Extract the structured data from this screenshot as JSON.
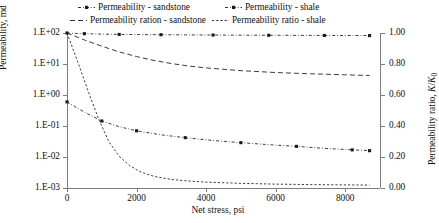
{
  "chart_data": {
    "type": "line",
    "title": "",
    "xlabel": "Net stress, psi",
    "ylabel_left": "Permeability, md",
    "ylabel_right": "Permeability ratio, K/K0",
    "xlim": [
      0,
      9000
    ],
    "xticks": [
      0,
      2000,
      4000,
      6000,
      8000
    ],
    "xticklabels": [
      "0",
      "2000",
      "4000",
      "6000",
      "8000"
    ],
    "y_left_scale": "log",
    "ylim_left": [
      0.001,
      100
    ],
    "yticks_left": [
      100,
      10,
      1,
      0.1,
      0.01,
      0.001
    ],
    "yticklabels_left": [
      "1.E+02",
      "1.E+01",
      "1.E+00",
      "1.E-01",
      "1.E-02",
      "1.E-03"
    ],
    "y_right_scale": "linear",
    "ylim_right": [
      0.0,
      1.0
    ],
    "yticks_right": [
      1.0,
      0.8,
      0.6,
      0.4,
      0.2,
      0.0
    ],
    "yticklabels_right": [
      "1.00",
      "0.80",
      "0.60",
      "0.40",
      "0.20",
      "0.00"
    ],
    "grid": false,
    "legend_position": "top",
    "series": [
      {
        "name": "Permeability - sandstone",
        "axis": "left",
        "style": "dash-dot",
        "marker": "square",
        "x": [
          0,
          250,
          500,
          1000,
          1500,
          2000,
          2700,
          3400,
          4200,
          5000,
          5800,
          6600,
          7400,
          8200,
          8700
        ],
        "y": [
          100,
          97,
          95,
          92,
          90,
          89,
          88,
          87,
          86,
          85,
          84.5,
          84,
          83.5,
          83,
          82.5
        ]
      },
      {
        "name": "Permeability ration - sandstone",
        "axis": "right",
        "style": "dashed",
        "marker": "none",
        "x": [
          0,
          500,
          1000,
          1500,
          2000,
          2500,
          3000,
          3500,
          4000,
          5000,
          6000,
          7000,
          8000,
          8700
        ],
        "y": [
          1.0,
          0.955,
          0.915,
          0.878,
          0.848,
          0.823,
          0.803,
          0.787,
          0.775,
          0.757,
          0.745,
          0.737,
          0.73,
          0.726
        ]
      },
      {
        "name": "Permeability - shale",
        "axis": "left",
        "style": "dash-dot",
        "marker": "square",
        "x": [
          0,
          500,
          1000,
          1500,
          2000,
          2700,
          3400,
          4200,
          5000,
          5800,
          6600,
          7400,
          8200,
          8700
        ],
        "y": [
          0.6,
          0.28,
          0.145,
          0.095,
          0.07,
          0.052,
          0.042,
          0.034,
          0.029,
          0.025,
          0.022,
          0.019,
          0.017,
          0.016
        ]
      },
      {
        "name": "Permeability ratio - shale",
        "axis": "right",
        "style": "dotted",
        "marker": "none",
        "x": [
          0,
          300,
          600,
          900,
          1200,
          1500,
          1800,
          2100,
          2500,
          3000,
          3500,
          4000,
          5000,
          6000,
          7000,
          8000,
          8700
        ],
        "y": [
          1.0,
          0.82,
          0.63,
          0.45,
          0.3,
          0.205,
          0.145,
          0.105,
          0.075,
          0.055,
          0.045,
          0.038,
          0.03,
          0.025,
          0.022,
          0.02,
          0.019
        ]
      }
    ]
  },
  "legend": {
    "items": [
      {
        "label": "Permeability - sandstone",
        "key": "dash-dot-marker-key"
      },
      {
        "label": "Permeability - shale",
        "key": "dash-dot-marker-key"
      },
      {
        "label": "Permeability ration - sandstone",
        "key": "dashed-line-key"
      },
      {
        "label": "Permeability ratio - shale",
        "key": "dotted-line-key"
      }
    ]
  },
  "axes": {
    "x_title": "Net stress, psi",
    "y_left_title": "Permeability, md",
    "y_right_title_main": "Permeability ratio, ",
    "y_right_title_sym": "K",
    "y_right_title_slash": "/",
    "y_right_title_sym2": "K",
    "y_right_title_sub": "0"
  },
  "colors": {
    "line": "#1a1a1a",
    "axis": "#7d7d7d",
    "text": "#111111",
    "background": "#ffffff"
  }
}
